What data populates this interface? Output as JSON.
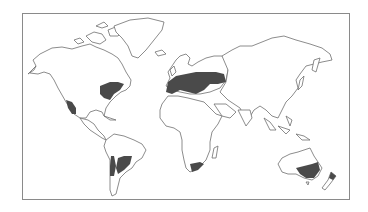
{
  "map": {
    "type": "world-distribution-map",
    "projection": "outline world map",
    "colors": {
      "background": "#ffffff",
      "land_fill": "#ffffff",
      "coastline": "#6e6e6e",
      "highlight": "#4a4a4a",
      "frame": "#8a8a8a"
    },
    "highlighted_regions": [
      {
        "id": "western-north-america",
        "label": "California / western North America"
      },
      {
        "id": "eastern-north-america",
        "label": "Eastern United States"
      },
      {
        "id": "europe-mediterranean",
        "label": "Europe and Mediterranean"
      },
      {
        "id": "southern-south-america",
        "label": "Chile and Argentina"
      },
      {
        "id": "south-africa",
        "label": "Southern tip of Africa"
      },
      {
        "id": "southeast-australia",
        "label": "Southeastern Australia"
      },
      {
        "id": "new-zealand",
        "label": "New Zealand"
      }
    ]
  }
}
